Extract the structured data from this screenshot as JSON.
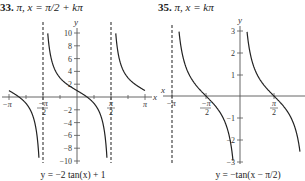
{
  "problems": [
    {
      "number": "33.",
      "answer": "π, x = π/2 + kπ",
      "equation": "y = −2 tan(x) + 1",
      "axes": {
        "x_label": "x",
        "y_label": "y",
        "x_ticks": [
          "−π",
          "−π/2",
          "π/2",
          "π"
        ],
        "y_ticks": [
          "10",
          "8",
          "6",
          "4",
          "2",
          "−2",
          "−4",
          "−6",
          "−8",
          "−10"
        ]
      }
    },
    {
      "number": "35.",
      "answer": "π, x = kπ",
      "equation": "y = −tan(x − π/2)",
      "axes": {
        "x_label": "x",
        "y_label": "y",
        "x_ticks": [
          "−π",
          "−π/2",
          "π/2"
        ],
        "y_ticks": [
          "3",
          "2",
          "1",
          "−1",
          "−2",
          "−3"
        ]
      }
    }
  ],
  "chart_data": [
    {
      "type": "line",
      "title": "y = −2 tan(x) + 1",
      "xlabel": "x",
      "ylabel": "y",
      "xlim": [
        -3.1416,
        3.1416
      ],
      "ylim": [
        -10,
        10
      ],
      "x_tick_labels": [
        "−π",
        "−π/2",
        "π/2",
        "π"
      ],
      "y_tick_values": [
        -10,
        -8,
        -6,
        -4,
        -2,
        2,
        4,
        6,
        8,
        10
      ],
      "asymptotes": [
        -1.5708,
        1.5708
      ],
      "series": [
        {
          "name": "y = −2 tan(x) + 1",
          "x": [
            -3.1416,
            -2.5,
            -2.0,
            -1.75,
            -1.65,
            0,
            0.5,
            1.0,
            1.4,
            1.5,
            1.65,
            2.0,
            2.5,
            3.1416
          ],
          "y": [
            1.0,
            -0.49,
            -3.37,
            -7.76,
            -10.0,
            1.0,
            -0.09,
            -2.11,
            -10.59,
            -27.2,
            12.55,
            5.37,
            2.49,
            1.0
          ]
        }
      ],
      "grid": false
    },
    {
      "type": "line",
      "title": "y = −tan(x − π/2)",
      "xlabel": "x",
      "ylabel": "y",
      "xlim": [
        -3.1416,
        2.77
      ],
      "ylim": [
        -3,
        3
      ],
      "x_tick_labels": [
        "−π",
        "−π/2",
        "π/2"
      ],
      "y_tick_values": [
        -3,
        -2,
        -1,
        1,
        2,
        3
      ],
      "asymptotes": [
        -3.1416,
        0
      ],
      "series": [
        {
          "name": "y = −tan(x − π/2)",
          "x": [
            -2.82,
            -2.5,
            -2.0,
            -1.5708,
            -1.0,
            -0.5,
            -0.32,
            0.32,
            0.5,
            1.0,
            1.5708,
            2.0,
            2.5,
            2.82
          ],
          "y": [
            3.0,
            1.34,
            0.46,
            0.0,
            -0.64,
            -1.83,
            -3.0,
            3.0,
            1.83,
            0.64,
            0.0,
            -0.46,
            -1.34,
            -3.0
          ]
        }
      ],
      "grid": false
    }
  ]
}
